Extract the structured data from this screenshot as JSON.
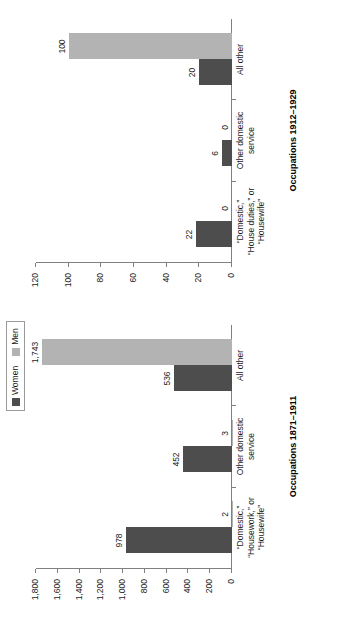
{
  "legend": {
    "entries": [
      {
        "label": "Women",
        "color": "#4d4d4d",
        "icon": "legend-swatch-women"
      },
      {
        "label": "Men",
        "color": "#b3b3b3",
        "icon": "legend-swatch-men"
      }
    ]
  },
  "chart_data": [
    {
      "type": "bar",
      "id": "occupations-1871-1911",
      "title": "Occupations 1871–1911",
      "xlabel": "",
      "ylabel": "",
      "ylim": [
        0,
        1800
      ],
      "grid": false,
      "legend_position": "top-left",
      "ticks": [
        "0",
        "200",
        "400",
        "600",
        "800",
        "1,000",
        "1,200",
        "1,400",
        "1,600",
        "1,800"
      ],
      "tick_values": [
        0,
        200,
        400,
        600,
        800,
        1000,
        1200,
        1400,
        1600,
        1800
      ],
      "categories": [
        "“Domestic,”\n“Housework,” or\n“Housewife”",
        "Other domestic\nservice",
        "All other"
      ],
      "series": [
        {
          "name": "Women",
          "color": "#4d4d4d",
          "values": [
            978,
            452,
            536
          ],
          "labels": [
            "978",
            "452",
            "536"
          ]
        },
        {
          "name": "Men",
          "color": "#b3b3b3",
          "values": [
            2,
            3,
            1743
          ],
          "labels": [
            "2",
            "3",
            "1,743"
          ]
        }
      ]
    },
    {
      "type": "bar",
      "id": "occupations-1912-1929",
      "title": "Occupations 1912–1929",
      "xlabel": "",
      "ylabel": "",
      "ylim": [
        0,
        120
      ],
      "grid": false,
      "legend_position": "top-left",
      "ticks": [
        "0",
        "20",
        "40",
        "60",
        "80",
        "100",
        "120"
      ],
      "tick_values": [
        0,
        20,
        40,
        60,
        80,
        100,
        120
      ],
      "categories": [
        "“Domestic,”\n“House duties,” or\n“Housewife”",
        "Other domestic\nservice",
        "All other"
      ],
      "series": [
        {
          "name": "Women",
          "color": "#4d4d4d",
          "values": [
            22,
            6,
            20
          ],
          "labels": [
            "22",
            "6",
            "20"
          ]
        },
        {
          "name": "Men",
          "color": "#b3b3b3",
          "values": [
            0,
            0,
            100
          ],
          "labels": [
            "0",
            "0",
            "100"
          ]
        }
      ]
    }
  ]
}
